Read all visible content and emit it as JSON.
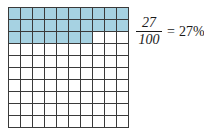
{
  "figure": {
    "name": "percent-hundredths-grid-figure"
  },
  "grid": {
    "rows": 10,
    "columns": 10,
    "total_cells": 100,
    "shaded_cells": 27,
    "shaded_per_row": [
      10,
      10,
      7,
      0,
      0,
      0,
      0,
      0,
      0,
      0
    ],
    "shaded_color": "#a6d2e2",
    "unshaded_color": "#ffffff",
    "line_color": "#3a3a3a"
  },
  "expression": {
    "numerator": "27",
    "denominator": "100",
    "equals": "=",
    "percent": "27%"
  },
  "chart_data": {
    "type": "bar",
    "title": "",
    "categories": [
      "shaded",
      "unshaded"
    ],
    "values": [
      27,
      73
    ],
    "xlabel": "",
    "ylabel": "",
    "ylim": [
      0,
      100
    ]
  }
}
